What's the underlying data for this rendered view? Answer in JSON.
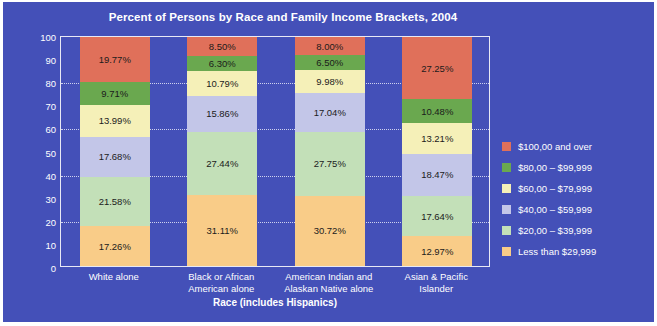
{
  "chart_data": {
    "type": "bar",
    "subtype": "stacked-percent",
    "title": "Percent of Persons by Race and Family Income Brackets, 2004",
    "xlabel": "Race (includes Hispanics)",
    "ylabel": "Percent",
    "ylim": [
      0,
      100
    ],
    "yticks": [
      0,
      10,
      20,
      30,
      40,
      50,
      60,
      70,
      80,
      90,
      100
    ],
    "gridlines": [
      20,
      40,
      60,
      80
    ],
    "grid": true,
    "legend_position": "right",
    "categories": [
      "White alone",
      "Black or African American alone",
      "American Indian and Alaskan Native alone",
      "Asian & Pacific Islander"
    ],
    "series": [
      {
        "name": "$100,00 and over",
        "color": "#e0705a",
        "values": [
          19.77,
          8.5,
          8.0,
          27.25
        ]
      },
      {
        "name": "$80,00 – $99,999",
        "color": "#6aa84f",
        "values": [
          9.71,
          6.3,
          6.5,
          10.48
        ]
      },
      {
        "name": "$60,00 – $79,999",
        "color": "#f5f0b8",
        "values": [
          13.99,
          10.79,
          9.98,
          13.21
        ]
      },
      {
        "name": "$40,00 – $59,999",
        "color": "#c3c6e8",
        "values": [
          17.68,
          15.86,
          17.04,
          18.47
        ]
      },
      {
        "name": "$20,00 – $39,999",
        "color": "#c3e0b8",
        "values": [
          21.58,
          27.44,
          27.75,
          17.64
        ]
      },
      {
        "name": "Less than $29,999",
        "color": "#f9cc88",
        "values": [
          17.26,
          31.11,
          30.72,
          12.97
        ]
      }
    ],
    "value_labels": [
      [
        "19.77%",
        "9.71%",
        "13.99%",
        "17.68%",
        "21.58%",
        "17.26%"
      ],
      [
        "8.50%",
        "6.30%",
        "10.79%",
        "15.86%",
        "27.44%",
        "31.11%"
      ],
      [
        "8.00%",
        "6.50%",
        "9.98%",
        "17.04%",
        "27.75%",
        "30.72%"
      ],
      [
        "27.25%",
        "10.48%",
        "13.21%",
        "18.47%",
        "17.64%",
        "12.97%"
      ]
    ],
    "category_label_lines": [
      [
        "White alone"
      ],
      [
        "Black or African",
        "American alone"
      ],
      [
        "American Indian and",
        "Alaskan Native alone"
      ],
      [
        "Asian & Pacific",
        "Islander"
      ]
    ],
    "background_color": "#4450b8",
    "text_color": "#ffffff"
  }
}
